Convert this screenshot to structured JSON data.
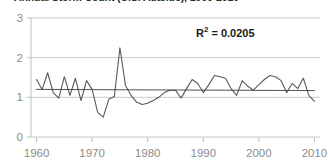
{
  "chart_data": {
    "type": "line",
    "title": "Annual Storm Count (U.S. Atlantic), 1960-2010",
    "xlabel": "",
    "ylabel": "",
    "xlim": [
      1959,
      2011
    ],
    "ylim": [
      0,
      3
    ],
    "yticks": [
      0,
      1,
      2,
      3
    ],
    "ytick_labels": [
      "0",
      "1",
      "2",
      "3"
    ],
    "xticks": [
      1960,
      1970,
      1980,
      1990,
      2000,
      2010
    ],
    "xtick_labels": [
      "1960",
      "1970",
      "1980",
      "1990",
      "2000",
      "2010"
    ],
    "grid": true,
    "grid_axis": "y",
    "legend": false,
    "annotations": [
      {
        "name": "r-squared",
        "text_prefix": "R",
        "text_sup": "2",
        "text_suffix": " = 0.0205",
        "value": 0.0205
      }
    ],
    "series": [
      {
        "name": "annual-value",
        "color": "#595959",
        "x": [
          1960,
          1961,
          1962,
          1963,
          1964,
          1965,
          1966,
          1967,
          1968,
          1969,
          1970,
          1971,
          1972,
          1973,
          1974,
          1975,
          1976,
          1977,
          1978,
          1979,
          1980,
          1981,
          1982,
          1983,
          1984,
          1985,
          1986,
          1987,
          1988,
          1989,
          1990,
          1991,
          1992,
          1993,
          1994,
          1995,
          1996,
          1997,
          1998,
          1999,
          2000,
          2001,
          2002,
          2003,
          2004,
          2005,
          2006,
          2007,
          2008,
          2009,
          2010
        ],
        "values": [
          1.45,
          1.2,
          1.62,
          1.12,
          0.98,
          1.52,
          1.05,
          1.48,
          0.92,
          1.42,
          1.2,
          0.62,
          0.5,
          0.95,
          1.02,
          2.25,
          1.3,
          1.05,
          0.88,
          0.82,
          0.85,
          0.92,
          1.0,
          1.12,
          1.18,
          1.18,
          0.98,
          1.22,
          1.45,
          1.35,
          1.12,
          1.32,
          1.55,
          1.52,
          1.48,
          1.22,
          1.05,
          1.42,
          1.28,
          1.18,
          1.32,
          1.45,
          1.55,
          1.52,
          1.42,
          1.12,
          1.35,
          1.22,
          1.48,
          1.05,
          0.9
        ]
      },
      {
        "name": "linear-trendline",
        "color": "#404040",
        "x": [
          1960,
          2010
        ],
        "values": [
          1.2,
          1.17
        ]
      }
    ]
  }
}
